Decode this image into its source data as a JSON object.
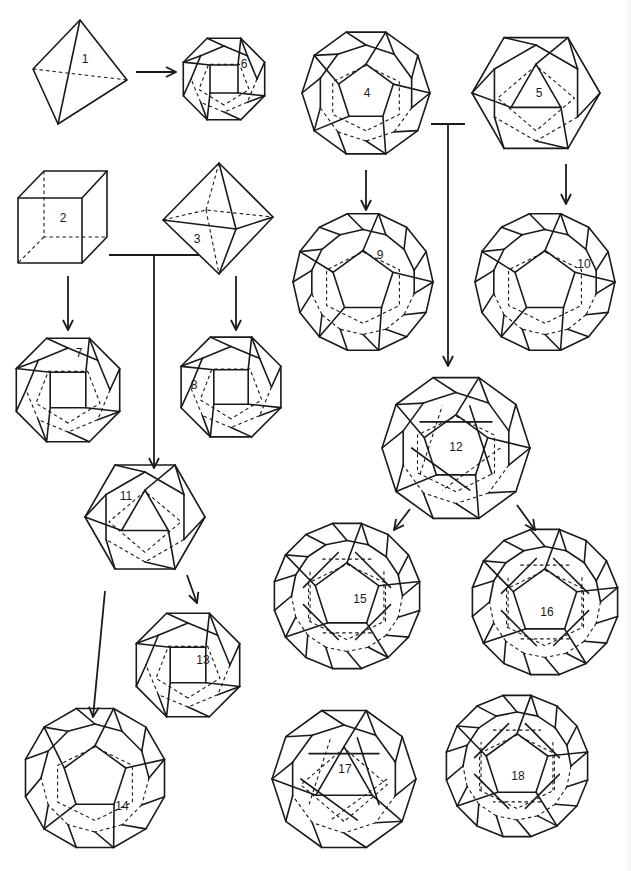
{
  "diagram": {
    "colors": {
      "line": "#1a1a1a",
      "background": "#ffffff"
    },
    "solids": [
      {
        "id": 1,
        "label": "1",
        "name": "tetrahedron",
        "cx": 78,
        "cy": 72,
        "r": 50,
        "sides": 3,
        "label_x": 85,
        "label_y": 60
      },
      {
        "id": 2,
        "label": "2",
        "name": "cube",
        "cx": 62,
        "cy": 218,
        "r": 48,
        "sides": 4,
        "label_x": 63,
        "label_y": 219
      },
      {
        "id": 3,
        "label": "3",
        "name": "octahedron",
        "cx": 218,
        "cy": 217,
        "r": 55,
        "sides": 4,
        "label_x": 197,
        "label_y": 240
      },
      {
        "id": 4,
        "label": "4",
        "name": "dodecahedron",
        "cx": 366,
        "cy": 93,
        "r": 64,
        "sides": 10,
        "label_x": 367,
        "label_y": 94
      },
      {
        "id": 5,
        "label": "5",
        "name": "icosahedron",
        "cx": 536,
        "cy": 93,
        "r": 64,
        "sides": 6,
        "label_x": 539,
        "label_y": 94
      },
      {
        "id": 6,
        "label": "6",
        "name": "truncated-tetrahedron",
        "cx": 224,
        "cy": 79,
        "r": 44,
        "sides": 8,
        "label_x": 244,
        "label_y": 65
      },
      {
        "id": 7,
        "label": "7",
        "name": "truncated-cube",
        "cx": 68,
        "cy": 390,
        "r": 56,
        "sides": 8,
        "label_x": 79,
        "label_y": 354
      },
      {
        "id": 8,
        "label": "8",
        "name": "truncated-octahedron",
        "cx": 231,
        "cy": 387,
        "r": 54,
        "sides": 8,
        "label_x": 194,
        "label_y": 386
      },
      {
        "id": 9,
        "label": "9",
        "name": "truncated-dodecahedron",
        "cx": 363,
        "cy": 282,
        "r": 70,
        "sides": 14,
        "label_x": 380,
        "label_y": 256
      },
      {
        "id": 10,
        "label": "10",
        "name": "truncated-icosahedron",
        "cx": 545,
        "cy": 282,
        "r": 70,
        "sides": 14,
        "label_x": 584,
        "label_y": 265
      },
      {
        "id": 11,
        "label": "11",
        "name": "cuboctahedron",
        "cx": 145,
        "cy": 517,
        "r": 60,
        "sides": 6,
        "label_x": 126,
        "label_y": 497
      },
      {
        "id": 12,
        "label": "12",
        "name": "icosidodecahedron",
        "cx": 456,
        "cy": 448,
        "r": 74,
        "sides": 10,
        "label_x": 456,
        "label_y": 448
      },
      {
        "id": 13,
        "label": "13",
        "name": "rhombicuboctahedron",
        "cx": 188,
        "cy": 665,
        "r": 56,
        "sides": 8,
        "label_x": 203,
        "label_y": 661
      },
      {
        "id": 14,
        "label": "14",
        "name": "truncated-cuboctahedron",
        "cx": 95,
        "cy": 778,
        "r": 72,
        "sides": 12,
        "label_x": 122,
        "label_y": 807
      },
      {
        "id": 15,
        "label": "15",
        "name": "rhombicosidodecahedron",
        "cx": 347,
        "cy": 596,
        "r": 74,
        "sides": 16,
        "label_x": 360,
        "label_y": 600
      },
      {
        "id": 16,
        "label": "16",
        "name": "truncated-icosidodecahedron",
        "cx": 545,
        "cy": 602,
        "r": 74,
        "sides": 16,
        "label_x": 547,
        "label_y": 613
      },
      {
        "id": 17,
        "label": "17",
        "name": "snub-cube",
        "cx": 344,
        "cy": 779,
        "r": 72,
        "sides": 10,
        "label_x": 345,
        "label_y": 770
      },
      {
        "id": 18,
        "label": "18",
        "name": "snub-dodecahedron",
        "cx": 517,
        "cy": 766,
        "r": 72,
        "sides": 16,
        "label_x": 518,
        "label_y": 777
      }
    ],
    "arrows": [
      {
        "from": "1",
        "to": "6",
        "x1": 136,
        "y1": 72,
        "x2": 176,
        "y2": 72
      },
      {
        "from": "2",
        "to": "7",
        "x1": 68,
        "y1": 276,
        "x2": 68,
        "y2": 330
      },
      {
        "from": "3",
        "to": "8",
        "x1": 236,
        "y1": 276,
        "x2": 236,
        "y2": 330
      },
      {
        "from": "2+3",
        "to": "11",
        "x1": 154,
        "y1": 255,
        "x2": 154,
        "y2": 468,
        "bar": [
          109,
          199
        ]
      },
      {
        "from": "4",
        "to": "9",
        "x1": 366,
        "y1": 170,
        "x2": 366,
        "y2": 210
      },
      {
        "from": "5",
        "to": "10",
        "x1": 566,
        "y1": 164,
        "x2": 566,
        "y2": 204
      },
      {
        "from": "4+5",
        "to": "12",
        "x1": 448,
        "y1": 124,
        "x2": 448,
        "y2": 366,
        "bar": [
          431,
          465
        ]
      },
      {
        "from": "11",
        "to": "13",
        "x1": 187,
        "y1": 575,
        "x2": 197,
        "y2": 603
      },
      {
        "from": "11",
        "to": "14",
        "x1": 105,
        "y1": 591,
        "x2": 93,
        "y2": 717
      },
      {
        "from": "12",
        "to": "15",
        "x1": 410,
        "y1": 509,
        "x2": 394,
        "y2": 530
      },
      {
        "from": "12",
        "to": "16",
        "x1": 517,
        "y1": 505,
        "x2": 535,
        "y2": 530
      }
    ]
  }
}
